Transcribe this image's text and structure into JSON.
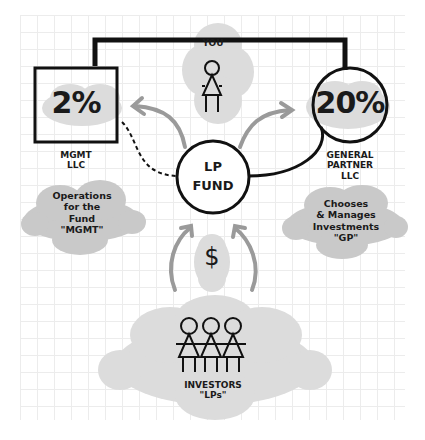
{
  "diagram": {
    "you": {
      "label": "YOU"
    },
    "mgmt": {
      "percent": "2%",
      "name_line1": "MGMT",
      "name_line2": "LLC",
      "desc": [
        "Operations",
        "for the",
        "Fund",
        "\"MGMT\""
      ]
    },
    "gp": {
      "percent": "20%",
      "name_line1": "GENERAL",
      "name_line2": "PARTNER",
      "name_line3": "LLC",
      "desc": [
        "Chooses",
        "& Manages",
        "Investments",
        "\"GP\""
      ]
    },
    "fund": {
      "line1": "LP",
      "line2": "FUND"
    },
    "money": {
      "symbol": "$"
    },
    "investors": {
      "label": "INVESTORS",
      "sublabel": "\"LPs\""
    }
  },
  "colors": {
    "ink": "#111111",
    "cloud": "#c9c9c9",
    "cloud_light": "#dcdcdc",
    "arrow": "#9a9a9a",
    "grid": "#ececec"
  }
}
